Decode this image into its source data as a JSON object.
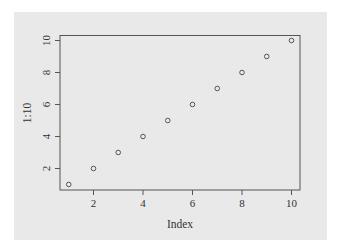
{
  "chart_data": {
    "type": "scatter",
    "title": "",
    "xlabel": "Index",
    "ylabel": "1:10",
    "x": [
      1,
      2,
      3,
      4,
      5,
      6,
      7,
      8,
      9,
      10
    ],
    "y": [
      1,
      2,
      3,
      4,
      5,
      6,
      7,
      8,
      9,
      10
    ],
    "x_ticks": [
      "2",
      "4",
      "6",
      "8",
      "10"
    ],
    "y_ticks": [
      "2",
      "4",
      "6",
      "8",
      "10"
    ],
    "xlim": [
      0.64,
      10.36
    ],
    "ylim": [
      0.64,
      10.36
    ],
    "grid": false,
    "legend": null,
    "marker": "open-circle",
    "colors": {
      "panel_bg": "#e9e9e9",
      "page_bg": "#ffffff",
      "axis": "#555555",
      "point": "#555555"
    }
  }
}
